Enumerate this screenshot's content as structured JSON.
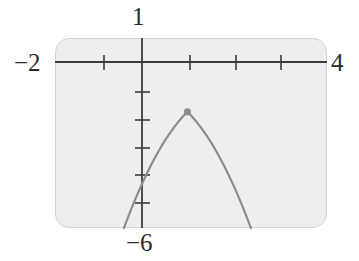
{
  "figure": {
    "kind": "graphing-calculator-screen"
  },
  "window_labels": {
    "ymax": "1",
    "xmin": "−2",
    "xmax": "4",
    "ymin": "−6"
  },
  "colors": {
    "screen_fill": "#eeeeee",
    "screen_border": "#d4d4d4",
    "axis": "#3a3a3a",
    "curve": "#8c8c8c",
    "point": "#8c8c8c",
    "text": "#2b2b2b"
  },
  "chart_data": {
    "type": "line",
    "title": "",
    "xlabel": "",
    "ylabel": "",
    "xlim": [
      -2,
      4
    ],
    "ylim": [
      -6,
      1
    ],
    "grid": false,
    "legend": "none",
    "xticks": [
      -1,
      1,
      2,
      3
    ],
    "yticks": [
      -1,
      -2,
      -3,
      -4,
      -5
    ],
    "xtick_labels": [
      "",
      "",
      "",
      ""
    ],
    "ytick_labels": [
      "",
      "",
      "",
      "",
      ""
    ],
    "annotations": [
      {
        "label": "1",
        "position": "above-y-axis",
        "meaning": "Ymax"
      },
      {
        "label": "-2",
        "position": "left-of-x-axis",
        "meaning": "Xmin"
      },
      {
        "label": "4",
        "position": "right-of-x-axis",
        "meaning": "Xmax"
      },
      {
        "label": "-6",
        "position": "below-y-axis",
        "meaning": "Ymin"
      }
    ],
    "series": [
      {
        "name": "parabola",
        "vertex": [
          1,
          -3
        ],
        "points": [
          [
            -0.4,
            -6.0
          ],
          [
            -0.3,
            -5.57
          ],
          [
            -0.2,
            -5.16
          ],
          [
            -0.1,
            -4.77
          ],
          [
            0,
            -4.4
          ],
          [
            0.1,
            -4.05
          ],
          [
            0.2,
            -3.72
          ],
          [
            0.3,
            -3.41
          ],
          [
            0.4,
            -3.12
          ],
          [
            0.5,
            -2.85
          ],
          [
            0.6,
            -2.6
          ],
          [
            0.7,
            -2.37
          ],
          [
            0.8,
            -2.16
          ],
          [
            0.9,
            -1.97
          ],
          [
            1.0,
            -1.8
          ],
          [
            1.1,
            -1.97
          ],
          [
            1.2,
            -2.16
          ],
          [
            1.3,
            -2.37
          ],
          [
            1.4,
            -2.6
          ],
          [
            1.5,
            -2.85
          ],
          [
            1.6,
            -3.12
          ],
          [
            1.7,
            -3.41
          ],
          [
            1.8,
            -3.72
          ],
          [
            1.9,
            -4.05
          ],
          [
            2.0,
            -4.4
          ],
          [
            2.1,
            -4.77
          ],
          [
            2.2,
            -5.16
          ],
          [
            2.3,
            -5.57
          ],
          [
            2.4,
            -6.0
          ]
        ]
      }
    ],
    "markers": [
      {
        "name": "vertex-point",
        "x": 1,
        "y": -1.8,
        "style": "filled-circle"
      }
    ]
  }
}
